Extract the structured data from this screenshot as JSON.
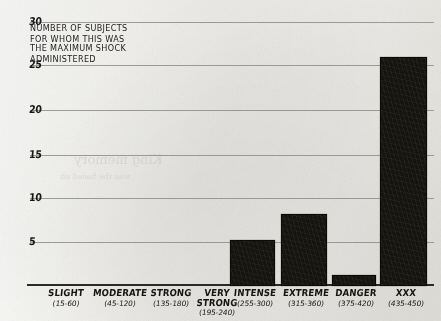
{
  "caption": "NUMBER OF SUBJECTS\nFOR WHOM THIS WAS\nTHE MAXIMUM SHOCK\nADMINISTERED",
  "axis": {
    "y_ticks": [
      "30",
      "25",
      "20",
      "15",
      "10",
      "5"
    ],
    "y_tick_values": [
      30,
      25,
      20,
      15,
      10,
      5
    ]
  },
  "colors": {
    "bar": "#15140f",
    "gridline": "#8e8c88",
    "axis": "#2b2a28",
    "ink": "#16150f",
    "paper": "#f4f3ef"
  },
  "chart_data": {
    "type": "bar",
    "title": "NUMBER OF SUBJECTS FOR WHOM THIS WAS THE MAXIMUM SHOCK ADMINISTERED",
    "xlabel": "",
    "ylabel": "NUMBER OF SUBJECTS FOR WHOM THIS WAS THE MAXIMUM SHOCK ADMINISTERED",
    "ylim": [
      0,
      30
    ],
    "ytick_step": 5,
    "grid": true,
    "legend": "none",
    "categories": [
      "SLIGHT",
      "MODERATE",
      "STRONG",
      "VERY STRONG",
      "INTENSE",
      "EXTREME",
      "DANGER",
      "XXX"
    ],
    "category_ranges": [
      "(15-60)",
      "(45-120)",
      "(135-180)",
      "(195-240)",
      "(255-300)",
      "(315-360)",
      "(375-420)",
      "(435-450)"
    ],
    "values": [
      0,
      0,
      0,
      0,
      5,
      8,
      1,
      26
    ],
    "bars": [
      {
        "label": "SLIGHT",
        "range": "(15-60)",
        "value": 0
      },
      {
        "label": "MODERATE",
        "range": "(45-120)",
        "value": 0
      },
      {
        "label": "STRONG",
        "range": "(135-180)",
        "value": 0
      },
      {
        "label": "VERY STRONG",
        "range": "(195-240)",
        "value": 0
      },
      {
        "label": "INTENSE",
        "range": "(255-300)",
        "value": 5
      },
      {
        "label": "EXTREME",
        "range": "(315-360)",
        "value": 8
      },
      {
        "label": "DANGER",
        "range": "(375-420)",
        "value": 1
      },
      {
        "label": "XXX",
        "range": "(435-450)",
        "value": 26
      }
    ]
  },
  "ghost_text": {
    "line1": "King memory",
    "line2": "was the based oh"
  }
}
